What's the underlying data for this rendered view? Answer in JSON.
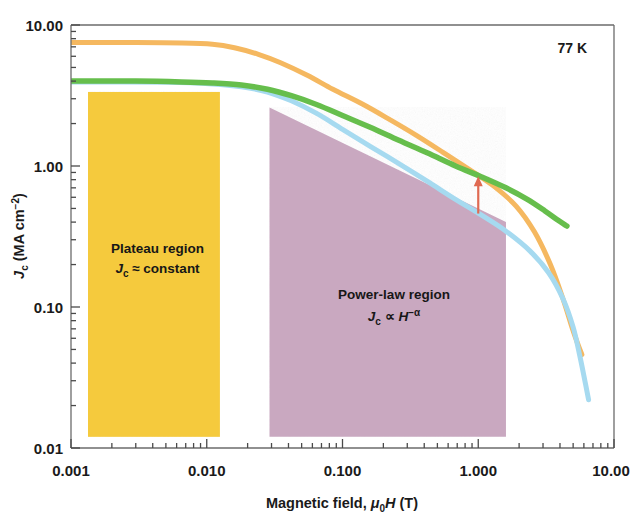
{
  "figure": {
    "temperature_label": "77 K",
    "background_color": "#ffffff",
    "frame_color": "#6b6b6b"
  },
  "axes": {
    "x": {
      "label_prefix": "Magnetic field, ",
      "label_mu": "μ",
      "label_mu_sub": "0",
      "label_H": "H",
      "label_unit": " (T)",
      "full_label": "Magnetic field, μ0H (T)",
      "ticks": [
        "0.001",
        "0.010",
        "0.100",
        "1.000",
        "10.00"
      ],
      "tick_values": [
        0.001,
        0.01,
        0.1,
        1.0,
        10.0
      ],
      "scale": "log",
      "range": [
        0.001,
        10.0
      ]
    },
    "y": {
      "label_J": "J",
      "label_J_sub": "c",
      "label_unit": " (MA cm",
      "label_exp": "−2",
      "label_close": ")",
      "full_label": "Jc (MA cm−2)",
      "ticks": [
        "10.00",
        "1.00",
        "0.10",
        "0.01"
      ],
      "tick_values": [
        10.0,
        1.0,
        0.1,
        0.01
      ],
      "scale": "log",
      "range": [
        0.01,
        10.0
      ]
    }
  },
  "annotations": {
    "plateau": {
      "title": "Plateau region",
      "formula_J": "J",
      "formula_sub": "c",
      "formula_rest": " ≈ constant",
      "formula_full": "Jc ≈ constant",
      "fill_color": "#f5ca3c",
      "x_range": [
        0.001,
        0.0125
      ],
      "y_range": [
        0.012,
        3.35
      ]
    },
    "powerlaw": {
      "title": "Power-law region",
      "formula_J": "J",
      "formula_sub": "c",
      "formula_prop": " ∝ ",
      "formula_H": "H",
      "formula_exp": "−α",
      "formula_full": "Jc ∝ H−α",
      "fill_color": "#c9a8c0",
      "x_range": [
        0.029,
        1.6
      ],
      "y_range": [
        0.012,
        2.6
      ]
    },
    "arrow": {
      "color": "#e06a52",
      "x": 1.0,
      "y_from": 0.46,
      "y_to": 0.82,
      "meaning": "enhancement-arrow"
    }
  },
  "chart_data": {
    "type": "line",
    "title": "",
    "subtitle": "77 K",
    "xlabel": "Magnetic field, μ0H (T)",
    "ylabel": "Jc (MA cm−2)",
    "xscale": "log",
    "yscale": "log",
    "xlim": [
      0.001,
      10.0
    ],
    "ylim": [
      0.01,
      10.0
    ],
    "xticks": [
      0.001,
      0.01,
      0.1,
      1.0,
      10.0
    ],
    "xticklabels": [
      "0.001",
      "0.010",
      "0.100",
      "1.000",
      "10.00"
    ],
    "yticks": [
      10.0,
      1.0,
      0.1,
      0.01
    ],
    "yticklabels": [
      "10.00",
      "1.00",
      "0.10",
      "0.01"
    ],
    "grid": false,
    "legend": "none",
    "series": [
      {
        "name": "orange-curve",
        "color": "#f5b860",
        "linewidth": 5,
        "x": [
          0.001,
          0.003,
          0.0065,
          0.011,
          0.016,
          0.024,
          0.035,
          0.055,
          0.085,
          0.14,
          0.22,
          0.35,
          0.55,
          0.85,
          1.3,
          1.9,
          2.6,
          3.4,
          4.2,
          4.9,
          5.4,
          5.8
        ],
        "y": [
          7.5,
          7.5,
          7.45,
          7.3,
          6.9,
          6.2,
          5.4,
          4.4,
          3.5,
          2.75,
          2.15,
          1.65,
          1.25,
          0.95,
          0.72,
          0.52,
          0.34,
          0.2,
          0.115,
          0.072,
          0.055,
          0.046
        ]
      },
      {
        "name": "green-curve",
        "color": "#66be4c",
        "linewidth": 5.5,
        "x": [
          0.001,
          0.003,
          0.0065,
          0.011,
          0.018,
          0.028,
          0.042,
          0.065,
          0.1,
          0.16,
          0.26,
          0.42,
          0.68,
          1.05,
          1.6,
          2.3,
          3.1,
          3.9,
          4.5
        ],
        "y": [
          4.0,
          4.0,
          3.95,
          3.88,
          3.75,
          3.5,
          3.15,
          2.72,
          2.28,
          1.88,
          1.52,
          1.24,
          1.0,
          0.84,
          0.7,
          0.58,
          0.48,
          0.41,
          0.375
        ]
      },
      {
        "name": "light-blue-curve",
        "color": "#a6daf0",
        "linewidth": 5,
        "x": [
          0.001,
          0.005,
          0.011,
          0.018,
          0.028,
          0.042,
          0.065,
          0.1,
          0.16,
          0.26,
          0.42,
          0.68,
          1.05,
          1.6,
          2.4,
          3.3,
          4.2,
          5.0,
          5.6,
          6.1,
          6.5
        ],
        "y": [
          3.95,
          3.92,
          3.82,
          3.65,
          3.35,
          2.9,
          2.35,
          1.82,
          1.38,
          1.04,
          0.78,
          0.58,
          0.45,
          0.345,
          0.25,
          0.175,
          0.115,
          0.072,
          0.045,
          0.03,
          0.022
        ]
      }
    ]
  }
}
